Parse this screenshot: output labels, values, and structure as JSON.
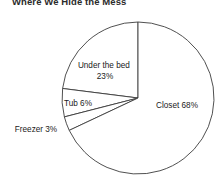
{
  "chart_data": {
    "type": "pie",
    "title": "Where We Hide the Mess",
    "xlabel": "",
    "ylabel": "",
    "grid": false,
    "legend": "none",
    "labels_position": "inside-and-outside",
    "start_angle_deg": 90,
    "direction": "counterclockwise",
    "categories": [
      "Closet",
      "Under the bed",
      "Tub",
      "Freezer"
    ],
    "values": [
      68,
      23,
      6,
      3
    ],
    "units": "percent",
    "slices": [
      {
        "name": "under-the-bed",
        "label_line1": "Under the bed",
        "label_line2": "23%",
        "value": 23,
        "percent_text": "23%",
        "label_x": 105,
        "label_y": 68,
        "label_anchor": "middle",
        "two_line": true
      },
      {
        "name": "tub",
        "label_line1": "Tub 6%",
        "label_line2": "",
        "value": 6,
        "percent_text": "6%",
        "label_x": 78,
        "label_y": 106,
        "label_anchor": "middle",
        "two_line": false
      },
      {
        "name": "freezer",
        "label_line1": "Freezer 3%",
        "label_line2": "",
        "value": 3,
        "percent_text": "3%",
        "label_x": 36,
        "label_y": 132,
        "label_anchor": "middle",
        "two_line": false
      },
      {
        "name": "closet",
        "label_line1": "Closet 68%",
        "label_line2": "",
        "value": 68,
        "percent_text": "68%",
        "label_x": 177,
        "label_y": 108,
        "label_anchor": "middle",
        "two_line": false
      }
    ],
    "geometry": {
      "center_x": 138,
      "center_y": 98,
      "radius": 76
    },
    "colors": {
      "slice_fill": "#ffffff",
      "slice_stroke": "#3c3c3c",
      "text": "#1a1a1a",
      "background": "#ffffff"
    }
  }
}
